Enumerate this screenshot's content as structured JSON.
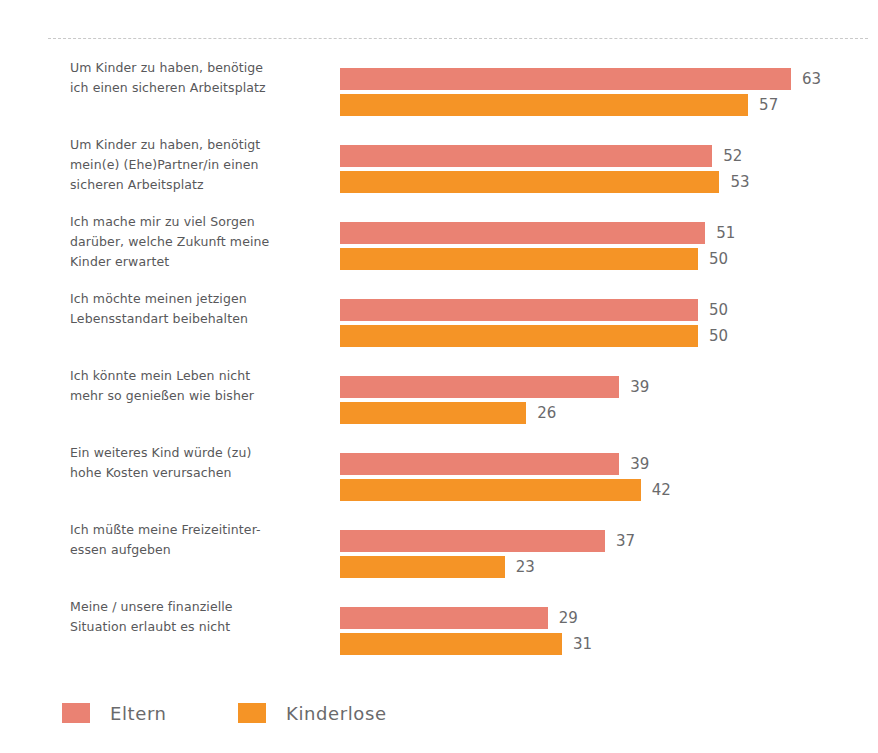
{
  "chart_data": {
    "type": "bar",
    "orientation": "horizontal",
    "title": "",
    "subtitle": "",
    "xlabel": "",
    "ylabel": "",
    "grid": false,
    "legend_position": "bottom-left",
    "xlim": [
      0,
      63
    ],
    "categories": [
      "Um Kinder zu haben, benötige\nich einen sicheren Arbeitsplatz",
      "Um Kinder zu haben, benötigt\nmein(e) (Ehe)Partner/in einen\nsicheren Arbeitsplatz",
      "Ich mache mir zu viel Sorgen\ndarüber, welche Zukunft meine\nKinder erwartet",
      "Ich möchte meinen jetzigen\nLebensstandart beibehalten",
      "Ich könnte mein Leben nicht\nmehr so genießen wie bisher",
      "Ein weiteres Kind würde (zu)\nhohe Kosten verursachen",
      "Ich müßte meine Freizeitinter-\nessen aufgeben",
      "Meine / unsere finanzielle\nSituation erlaubt es nicht"
    ],
    "series": [
      {
        "name": "Eltern",
        "color": "#ea8273",
        "values": [
          63,
          52,
          51,
          50,
          39,
          39,
          37,
          29
        ]
      },
      {
        "name": "Kinderlose",
        "color": "#f59426",
        "values": [
          57,
          53,
          50,
          50,
          26,
          42,
          23,
          31
        ]
      }
    ]
  },
  "legend": {
    "items": [
      {
        "label": "Eltern",
        "color": "#ea8273",
        "swatch": "legend-swatch-eltern"
      },
      {
        "label": "Kinderlose",
        "color": "#f59426",
        "swatch": "legend-swatch-kinderlose"
      }
    ]
  },
  "layout": {
    "bar_px_per_unit": 7.16,
    "bar_origin_x": 340,
    "group_pitch": 77,
    "top_rule": "dashed-separator"
  }
}
